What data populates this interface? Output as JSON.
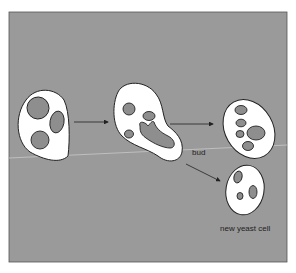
{
  "figure": {
    "type": "biology-diagram",
    "background_color": "#9a9a9a",
    "cell_fill": "#ffffff",
    "organelle_fill": "#8e8e8e",
    "outline_color": "#222222"
  },
  "labels": {
    "bud": "bud",
    "new_cell": "new yeast cell"
  },
  "stages": [
    {
      "id": "parent-cell",
      "description": "Parent yeast cell with three vacuoles/nuclei"
    },
    {
      "id": "budding-cell",
      "description": "Cell forming a bud; nucleus stretching into bud"
    },
    {
      "id": "parent-after-division",
      "description": "Parent cell after bud separates"
    },
    {
      "id": "new-yeast-cell",
      "description": "Newly separated daughter yeast cell"
    }
  ],
  "arrows": [
    {
      "from": "parent-cell",
      "to": "budding-cell"
    },
    {
      "from": "budding-cell",
      "to": "parent-after-division"
    },
    {
      "from": "budding-cell",
      "to": "new-yeast-cell"
    }
  ]
}
